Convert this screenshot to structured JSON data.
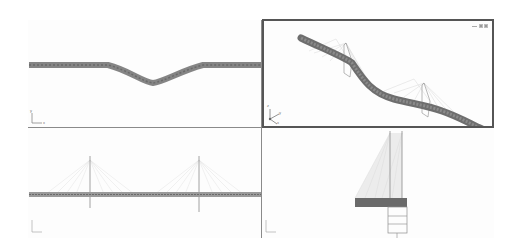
{
  "app": {
    "layout": "four-viewport",
    "active_viewport": "perspective"
  },
  "viewports": [
    {
      "id": "top",
      "view": "Top",
      "axis": {
        "x": "x",
        "y": "y"
      },
      "content": "bridge deck plan (S-curve)"
    },
    {
      "id": "perspective",
      "view": "Perspective",
      "axis": {
        "x": "x",
        "y": "y",
        "z": "z"
      },
      "content": "cable-stayed bridge 3D",
      "controls": [
        "minimize-icon",
        "restore-icon",
        "maximize-icon"
      ]
    },
    {
      "id": "front",
      "view": "Front",
      "axis": {
        "x": "x",
        "y": "z"
      },
      "content": "bridge elevation with two pylons"
    },
    {
      "id": "side",
      "view": "Left",
      "axis": {
        "x": "y",
        "y": "z"
      },
      "content": "bridge cross-section with pylon"
    }
  ],
  "colors": {
    "deck": "#7a7a7a",
    "deck_dark": "#606060",
    "cables": "#d4d4d4",
    "pylon": "#8c8c8c",
    "active_border": "#555555",
    "border": "#8a8a8a"
  }
}
